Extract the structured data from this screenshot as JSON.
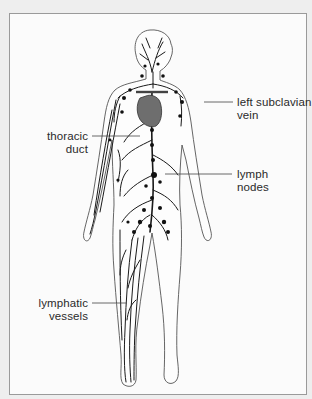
{
  "diagram": {
    "labels": [
      {
        "id": "left-subclavian-vein",
        "lines": [
          "left subclavian",
          "vein"
        ]
      },
      {
        "id": "thoracic-duct",
        "lines": [
          "thoracic",
          "duct"
        ]
      },
      {
        "id": "lymph-nodes",
        "lines": [
          "lymph",
          "nodes"
        ]
      },
      {
        "id": "lymphatic-vessels",
        "lines": [
          "lymphatic",
          "vessels"
        ]
      }
    ],
    "colors": {
      "frame_border": "#9a9a9a",
      "background": "#fbfbfb",
      "outline": "#555555",
      "vessels": "#1a1a1a",
      "heart": "#6e6e6e"
    }
  }
}
